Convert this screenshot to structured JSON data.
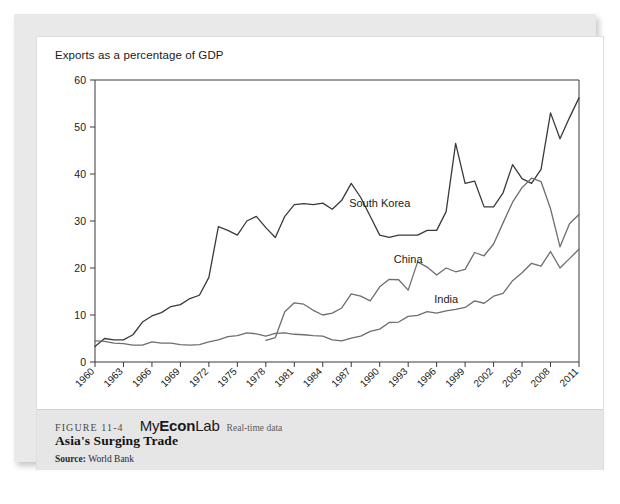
{
  "figure": {
    "number": "FIGURE 11-4",
    "brand_light": "My",
    "brand_bold_1": "Econ",
    "brand_bold_2": "Lab",
    "brand_full": "MyEconLab",
    "realtime_label": "Real-time data",
    "title": "Asia's Surging Trade",
    "source_label": "Source:",
    "source_value": "World Bank"
  },
  "chart_data": {
    "type": "line",
    "title": "",
    "axis_note": "Exports as a percentage of GDP",
    "xlabel": "",
    "ylabel": "Exports as a percentage of GDP",
    "ylim": [
      0,
      60
    ],
    "yticks": [
      0,
      10,
      20,
      30,
      40,
      50,
      60
    ],
    "xlim": [
      1960,
      2011
    ],
    "xticks": [
      1960,
      1963,
      1966,
      1969,
      1972,
      1975,
      1978,
      1981,
      1984,
      1987,
      1990,
      1993,
      1996,
      1999,
      2002,
      2005,
      2008,
      2011
    ],
    "grid": false,
    "legend_position": "inline-annotations",
    "x": [
      1960,
      1961,
      1962,
      1963,
      1964,
      1965,
      1966,
      1967,
      1968,
      1969,
      1970,
      1971,
      1972,
      1973,
      1974,
      1975,
      1976,
      1977,
      1978,
      1979,
      1980,
      1981,
      1982,
      1983,
      1984,
      1985,
      1986,
      1987,
      1988,
      1989,
      1990,
      1991,
      1992,
      1993,
      1994,
      1995,
      1996,
      1997,
      1998,
      1999,
      2000,
      2001,
      2002,
      2003,
      2004,
      2005,
      2006,
      2007,
      2008,
      2009,
      2010,
      2011
    ],
    "series": [
      {
        "name": "South Korea",
        "color": "#3a3a3a",
        "label_x": 1990,
        "label_y": 33,
        "values": [
          3.3,
          5.0,
          4.7,
          4.7,
          5.8,
          8.5,
          9.8,
          10.5,
          11.8,
          12.2,
          13.5,
          14.2,
          18.0,
          28.8,
          28.0,
          27.0,
          30.0,
          31.0,
          28.6,
          26.5,
          31.0,
          33.5,
          33.7,
          33.5,
          33.8,
          32.5,
          34.4,
          38.0,
          35.0,
          31.0,
          27.0,
          26.5,
          27.0,
          27.0,
          27.0,
          28.0,
          28.0,
          32.0,
          46.5,
          38.0,
          38.5,
          33.0,
          33.0,
          36.0,
          42.0,
          39.0,
          38.0,
          41.0,
          53.0,
          47.5,
          52.0,
          56.2
        ]
      },
      {
        "name": "China",
        "color": "#6e6e6e",
        "label_x": 1993,
        "label_y": 21,
        "start_year": 1978,
        "values": [
          null,
          null,
          null,
          null,
          null,
          null,
          null,
          null,
          null,
          null,
          null,
          null,
          null,
          null,
          null,
          null,
          null,
          null,
          4.6,
          5.2,
          10.7,
          12.6,
          12.3,
          11.0,
          10.0,
          10.4,
          11.5,
          14.5,
          14.0,
          13.0,
          16.0,
          17.6,
          17.5,
          15.3,
          21.3,
          20.2,
          18.5,
          20.0,
          19.2,
          19.7,
          23.3,
          22.6,
          25.1,
          29.6,
          34.0,
          37.1,
          39.1,
          38.4,
          32.6,
          24.5,
          29.4,
          31.4
        ]
      },
      {
        "name": "India",
        "color": "#6e6e6e",
        "label_x": 1997,
        "label_y": 12.5,
        "values": [
          4.5,
          4.4,
          4.0,
          3.9,
          3.6,
          3.6,
          4.3,
          4.0,
          4.0,
          3.7,
          3.6,
          3.7,
          4.3,
          4.7,
          5.4,
          5.6,
          6.2,
          6.0,
          5.5,
          6.1,
          6.2,
          5.9,
          5.8,
          5.6,
          5.5,
          4.7,
          4.5,
          5.1,
          5.5,
          6.5,
          7.0,
          8.4,
          8.5,
          9.7,
          9.9,
          10.7,
          10.4,
          10.9,
          11.2,
          11.6,
          13.0,
          12.5,
          14.0,
          14.6,
          17.3,
          19.0,
          21.0,
          20.4,
          23.5,
          20.0,
          22.0,
          24.0
        ]
      }
    ]
  }
}
